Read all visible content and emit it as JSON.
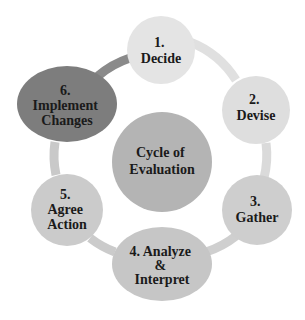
{
  "title": "Cycle of Evaluation",
  "center": {
    "label_lines": [
      "Cycle of",
      "Evaluation"
    ],
    "color": "#b4b4b4"
  },
  "ring_color": "#dcdcdc",
  "steps": [
    {
      "id": "decide",
      "label_lines": [
        "1.",
        "Decide"
      ],
      "color": "#e4e4e4"
    },
    {
      "id": "devise",
      "label_lines": [
        "2.",
        "Devise"
      ],
      "color": "#dedede"
    },
    {
      "id": "gather",
      "label_lines": [
        "3.",
        "Gather"
      ],
      "color": "#cecece"
    },
    {
      "id": "analyze",
      "label_lines": [
        "4. Analyze",
        "&",
        "Interpret"
      ],
      "color": "#c6c6c6"
    },
    {
      "id": "agree",
      "label_lines": [
        "5.",
        "Agree",
        "Action"
      ],
      "color": "#cbcbcb"
    },
    {
      "id": "implement",
      "label_lines": [
        "6.",
        "Implement",
        "Changes"
      ],
      "color": "#7d7d7d"
    }
  ]
}
